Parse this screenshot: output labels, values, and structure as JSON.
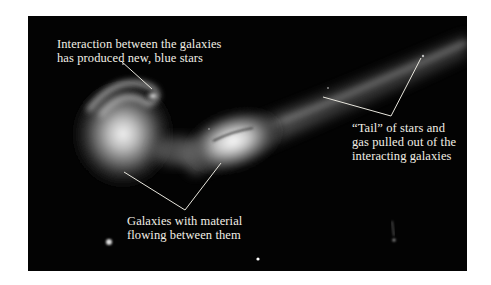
{
  "figure": {
    "annotations": [
      {
        "id": "blue-stars",
        "lines": [
          "Interaction between the galaxies",
          "has produced new, blue stars"
        ]
      },
      {
        "id": "tidal-tail",
        "lines": [
          "“Tail” of stars and",
          "gas pulled out of the",
          "interacting galaxies"
        ]
      },
      {
        "id": "material-flow",
        "lines": [
          "Galaxies with material",
          "flowing between them"
        ]
      }
    ],
    "colors": {
      "background": "#ffffff",
      "sky": "#030303",
      "label_text": "#f2efe6",
      "leader_line": "#e8e6dd"
    }
  }
}
